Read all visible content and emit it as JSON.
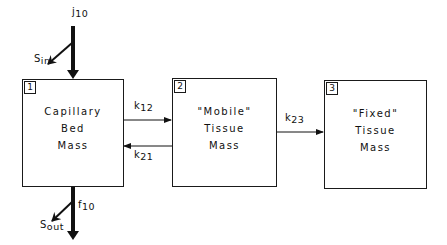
{
  "diagram": {
    "type": "compartment model",
    "compartments": [
      {
        "id": "1",
        "number": "1",
        "lines": [
          "Capillary",
          "Bed",
          "Mass"
        ]
      },
      {
        "id": "2",
        "number": "2",
        "lines": [
          "\"Mobile\"",
          "Tissue",
          "Mass"
        ]
      },
      {
        "id": "3",
        "number": "3",
        "lines": [
          "\"Fixed\"",
          "Tissue",
          "Mass"
        ]
      }
    ],
    "flows": {
      "input": {
        "symbol": "j",
        "subscript": "10"
      },
      "s_in": {
        "symbol": "S",
        "subscript": "in"
      },
      "k12": {
        "symbol": "k",
        "subscript": "12"
      },
      "k21": {
        "symbol": "k",
        "subscript": "21"
      },
      "k23": {
        "symbol": "k",
        "subscript": "23"
      },
      "output": {
        "symbol": "f",
        "subscript": "10"
      },
      "s_out": {
        "symbol": "S",
        "subscript": "out"
      }
    }
  }
}
